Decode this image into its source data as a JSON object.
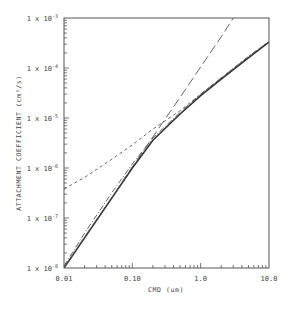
{
  "chart_data": {
    "type": "line",
    "title": "",
    "xlabel": "CMD (um)",
    "ylabel": "ATTACHMENT COEFFICIENT (cm³/s)",
    "xscale": "log",
    "yscale": "log",
    "xlim": [
      0.01,
      10.0
    ],
    "ylim": [
      1e-08,
      0.001
    ],
    "x_tick_labels": [
      "0.01",
      "0.10",
      "1.0",
      "10.0"
    ],
    "y_tick_labels": [
      {
        "base": "1 x 10",
        "exp": "-3"
      },
      {
        "base": "1 x 10",
        "exp": "-4"
      },
      {
        "base": "1 x 10",
        "exp": "-5"
      },
      {
        "base": "1 x 10",
        "exp": "-6"
      },
      {
        "base": "1 x 10",
        "exp": "-7"
      },
      {
        "base": "1 x 10",
        "exp": "-8"
      }
    ],
    "grid": false,
    "legend": "none",
    "series": [
      {
        "name": "solid",
        "style": "solid",
        "x": [
          0.01,
          0.02,
          0.05,
          0.1,
          0.2,
          0.5,
          1.0,
          2.0,
          5.0,
          10.0
        ],
        "y": [
          1e-08,
          4e-08,
          2.5e-07,
          1e-06,
          3.6e-06,
          1.2e-05,
          2.8e-05,
          6e-05,
          0.00016,
          0.00033
        ]
      },
      {
        "name": "dash-dot",
        "style": "dashdot",
        "x": [
          0.01,
          0.02,
          0.05,
          0.1,
          0.2,
          0.5,
          1.0,
          2.0,
          5.0,
          10.0
        ],
        "y": [
          1.1e-08,
          5e-08,
          3.2e-07,
          1.2e-06,
          4e-06,
          1.3e-05,
          3e-05,
          6.4e-05,
          0.00017,
          0.00034
        ]
      },
      {
        "name": "short-dash",
        "style": "shortdash",
        "x": [
          0.01,
          0.02,
          0.05,
          0.1,
          0.2,
          0.5,
          1.0,
          2.0,
          5.0,
          10.0
        ],
        "y": [
          3.8e-07,
          6.5e-07,
          1.5e-06,
          2.9e-06,
          6e-06,
          1.4e-05,
          3e-05,
          6.3e-05,
          0.00017,
          0.00034
        ]
      },
      {
        "name": "long-dash",
        "style": "longdash",
        "x": [
          0.01,
          0.02,
          0.05,
          0.1,
          0.2,
          0.5,
          1.0,
          2.0,
          3.0
        ],
        "y": [
          1e-08,
          4.2e-08,
          2.6e-07,
          1.05e-06,
          4.2e-06,
          2.6e-05,
          0.000105,
          0.00042,
          0.001
        ]
      }
    ]
  }
}
